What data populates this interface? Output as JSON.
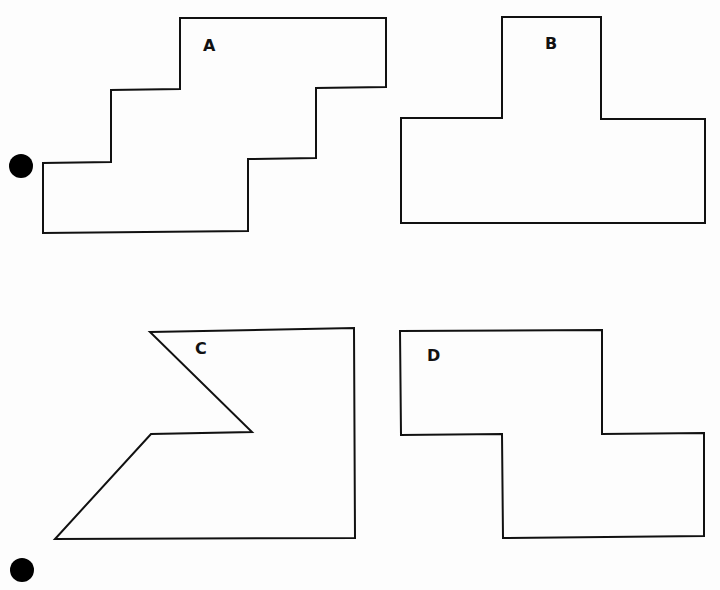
{
  "colors": {
    "stroke": "#111111",
    "background": "#fdfdfd",
    "dot": "#000000"
  },
  "shapes": [
    {
      "id": "A",
      "label": "A",
      "points": "180,18 386,18 386,87 316,88 316,158 248,159 248,231 43,233 43,163 111,162 111,90 180,89",
      "label_pos": [
        203,
        51
      ]
    },
    {
      "id": "B",
      "label": "B",
      "points": "502,17 601,17 601,119 705,119 705,223 401,223 401,118 502,118",
      "label_pos": [
        545,
        49
      ]
    },
    {
      "id": "C",
      "label": "C",
      "points": "150,332 354,328 355,538 55,539 151,434 252,432",
      "label_pos": [
        195,
        354
      ]
    },
    {
      "id": "D",
      "label": "D",
      "points": "400,331 602,330 602,434 704,433 704,536 503,538 502,434 401,435",
      "label_pos": [
        427,
        361
      ]
    }
  ],
  "markers": [
    {
      "id": "dot-top",
      "cx": 21,
      "cy": 166,
      "r": 12
    },
    {
      "id": "dot-bottom",
      "cx": 22,
      "cy": 570,
      "r": 12
    }
  ]
}
